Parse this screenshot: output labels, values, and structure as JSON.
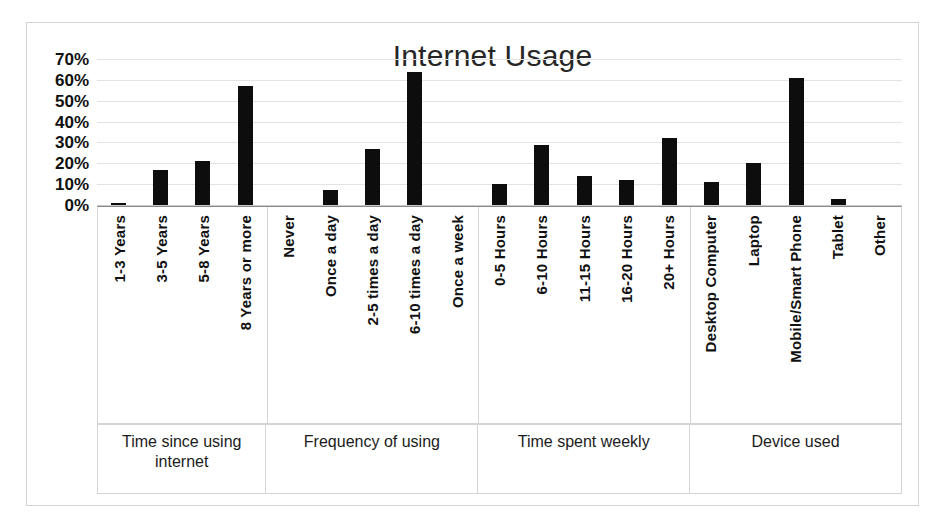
{
  "chart_data": {
    "type": "bar",
    "title": "Internet Usage",
    "xlabel": "",
    "ylabel": "",
    "ylim": [
      0,
      70
    ],
    "grid": true,
    "legend": "none",
    "orientation": "vertical",
    "bar_color": "#0d0d0d",
    "y_ticks": [
      "70%",
      "60%",
      "50%",
      "40%",
      "30%",
      "20%",
      "10%",
      "0%"
    ],
    "y_tick_values": [
      70,
      60,
      50,
      40,
      30,
      20,
      10,
      0
    ],
    "categories": [
      "1-3 Years",
      "3-5 Years",
      "5-8 Years",
      "8 Years or more",
      "Never",
      "Once a day",
      "2-5 times a day",
      "6-10 times a day",
      "Once a week",
      "0-5 Hours",
      "6-10 Hours",
      "11-15 Hours",
      "16-20 Hours",
      "20+ Hours",
      "Desktop Computer",
      "Laptop",
      "Mobile/Smart Phone",
      "Tablet",
      "Other"
    ],
    "values": [
      1,
      17,
      21,
      57,
      0,
      7,
      27,
      64,
      0,
      10,
      29,
      14,
      12,
      32,
      11,
      20,
      61,
      3,
      0
    ],
    "groups": [
      {
        "label": "Time since using internet",
        "span": 4
      },
      {
        "label": "Frequency of using",
        "span": 5
      },
      {
        "label": "Time spent weekly",
        "span": 5
      },
      {
        "label": "Device used",
        "span": 5
      }
    ]
  }
}
